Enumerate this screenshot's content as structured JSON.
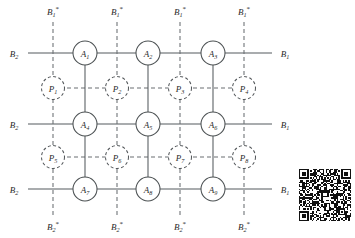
{
  "figure": {
    "background_color": "#ffffff",
    "line_color": "#555a5e",
    "dashed_color": "#6a6e72",
    "text_color": "#2b2b2b"
  },
  "geometry": {
    "width": 355,
    "height": 238,
    "a_columns_x": [
      85,
      148,
      213
    ],
    "a_rows_y": [
      53,
      124,
      189
    ],
    "p_columns_x": [
      53,
      117,
      180,
      244
    ],
    "p_rows_y": [
      88,
      157
    ],
    "a_radius": 12,
    "p_radius": 11.5,
    "left_margin_x": 28,
    "right_margin_x": 272,
    "top_margin_y": 22,
    "bottom_margin_y": 216
  },
  "nodes": {
    "switches": [
      {
        "id": "A1",
        "base": "A",
        "sub": "1",
        "col": 0,
        "row": 0
      },
      {
        "id": "A2",
        "base": "A",
        "sub": "2",
        "col": 1,
        "row": 0
      },
      {
        "id": "A3",
        "base": "A",
        "sub": "3",
        "col": 2,
        "row": 0
      },
      {
        "id": "A4",
        "base": "A",
        "sub": "4",
        "col": 0,
        "row": 1
      },
      {
        "id": "A5",
        "base": "A",
        "sub": "5",
        "col": 1,
        "row": 1
      },
      {
        "id": "A6",
        "base": "A",
        "sub": "6",
        "col": 2,
        "row": 1
      },
      {
        "id": "A7",
        "base": "A",
        "sub": "7",
        "col": 0,
        "row": 2
      },
      {
        "id": "A8",
        "base": "A",
        "sub": "8",
        "col": 1,
        "row": 2
      },
      {
        "id": "A9",
        "base": "A",
        "sub": "9",
        "col": 2,
        "row": 2
      }
    ],
    "processors": [
      {
        "id": "P1",
        "base": "P",
        "sub": "1",
        "col": 0,
        "row": 0
      },
      {
        "id": "P2",
        "base": "P",
        "sub": "2",
        "col": 1,
        "row": 0
      },
      {
        "id": "P3",
        "base": "P",
        "sub": "3",
        "col": 2,
        "row": 0
      },
      {
        "id": "P4",
        "base": "P",
        "sub": "4",
        "col": 3,
        "row": 0
      },
      {
        "id": "P5",
        "base": "P",
        "sub": "5",
        "col": 0,
        "row": 1
      },
      {
        "id": "P6",
        "base": "P",
        "sub": "6",
        "col": 1,
        "row": 1
      },
      {
        "id": "P7",
        "base": "P",
        "sub": "7",
        "col": 2,
        "row": 1
      },
      {
        "id": "P8",
        "base": "P",
        "sub": "8",
        "col": 3,
        "row": 1
      }
    ]
  },
  "port_labels": {
    "top": [
      {
        "base": "B",
        "sub": "1",
        "star": "*",
        "col": 0
      },
      {
        "base": "B",
        "sub": "1",
        "star": "*",
        "col": 1
      },
      {
        "base": "B",
        "sub": "1",
        "star": "*",
        "col": 2
      },
      {
        "base": "B",
        "sub": "1",
        "star": "*",
        "col": 3
      }
    ],
    "bottom": [
      {
        "base": "B",
        "sub": "2",
        "star": "*",
        "col": 0
      },
      {
        "base": "B",
        "sub": "2",
        "star": "*",
        "col": 1
      },
      {
        "base": "B",
        "sub": "2",
        "star": "*",
        "col": 2
      },
      {
        "base": "B",
        "sub": "2",
        "star": "*",
        "col": 3
      }
    ],
    "left": [
      {
        "base": "B",
        "sub": "2",
        "row": 0
      },
      {
        "base": "B",
        "sub": "2",
        "row": 1
      },
      {
        "base": "B",
        "sub": "2",
        "row": 2
      }
    ],
    "right": [
      {
        "base": "B",
        "sub": "1",
        "row": 0
      },
      {
        "base": "B",
        "sub": "1",
        "row": 1
      },
      {
        "base": "B",
        "sub": "1",
        "row": 2
      }
    ]
  },
  "qr_code": {
    "present": true,
    "x": 299,
    "y": 169,
    "size": 52,
    "label": "qr-code"
  }
}
